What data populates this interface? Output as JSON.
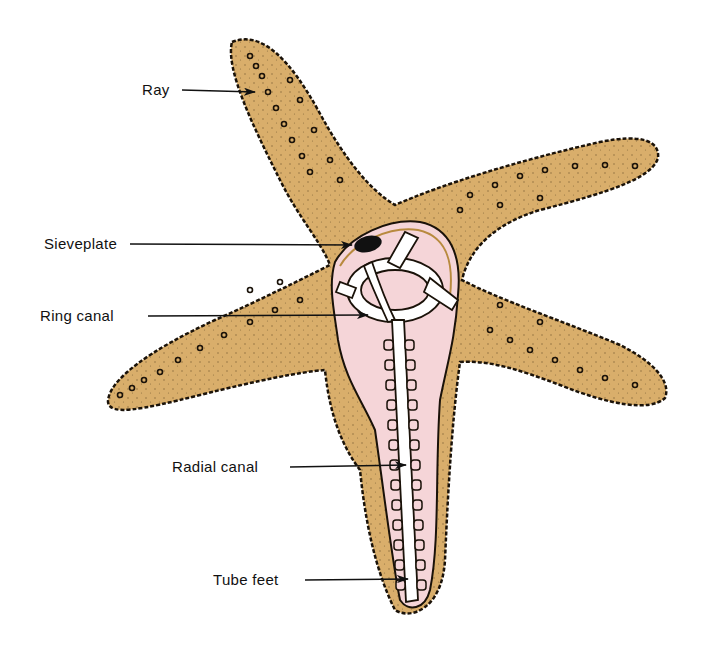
{
  "diagram": {
    "colors": {
      "body": "#D9AE6B",
      "body_outline": "#1a1209",
      "interior": "#F5D5D8",
      "canal": "#FFFFFF",
      "sieveplate": "#111111",
      "arrow": "#111111",
      "label_text": "#111111",
      "background": "#FFFFFF"
    },
    "labels": [
      {
        "id": "ray",
        "text": "Ray",
        "x": 142,
        "y": 79,
        "arrow_to": [
          255,
          92
        ]
      },
      {
        "id": "sieveplate",
        "text": "Sieveplate",
        "x": 44,
        "y": 233,
        "arrow_to": [
          352,
          245
        ]
      },
      {
        "id": "ring-canal",
        "text": "Ring canal",
        "x": 40,
        "y": 306,
        "arrow_to": [
          368,
          315
        ]
      },
      {
        "id": "radial-canal",
        "text": "Radial canal",
        "x": 172,
        "y": 458,
        "arrow_to": [
          406,
          465
        ]
      },
      {
        "id": "tube-feet",
        "text": "Tube feet",
        "x": 213,
        "y": 571,
        "arrow_to": [
          408,
          579
        ]
      }
    ]
  }
}
